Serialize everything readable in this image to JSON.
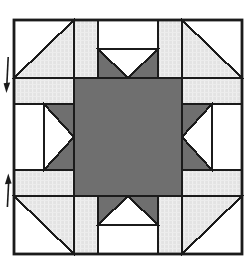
{
  "diagram": {
    "canvas": {
      "width": 248,
      "height": 280
    },
    "colors": {
      "background": "#ffffff",
      "outline": "#1b1b1b",
      "patch_white": "#ffffff",
      "patch_light": "#e3e3e3",
      "patch_light_texture": "#efefef",
      "patch_dark": "#6f6f6f",
      "arrow": "#1b1b1b"
    },
    "stroke": {
      "border_width": 2.8,
      "seam_width": 2.1,
      "arrow_shaft_width": 1.6
    },
    "block": {
      "x": 14,
      "y": 20,
      "width": 228,
      "height": 234
    },
    "pieces": [
      {
        "name": "center-square",
        "shape": "rect",
        "fill": "dark",
        "x": 74,
        "y": 78,
        "w": 108,
        "h": 118
      },
      {
        "name": "spacer-top-left",
        "shape": "rect",
        "fill": "light",
        "x": 74,
        "y": 20,
        "w": 24,
        "h": 58
      },
      {
        "name": "spacer-top-right",
        "shape": "rect",
        "fill": "light",
        "x": 158,
        "y": 20,
        "w": 24,
        "h": 58
      },
      {
        "name": "spacer-bottom-left",
        "shape": "rect",
        "fill": "light",
        "x": 74,
        "y": 196,
        "w": 24,
        "h": 58
      },
      {
        "name": "spacer-bottom-right",
        "shape": "rect",
        "fill": "light",
        "x": 158,
        "y": 196,
        "w": 24,
        "h": 58
      },
      {
        "name": "spacer-left-top",
        "shape": "rect",
        "fill": "light",
        "x": 14,
        "y": 78,
        "w": 60,
        "h": 26
      },
      {
        "name": "spacer-left-bottom",
        "shape": "rect",
        "fill": "light",
        "x": 14,
        "y": 170,
        "w": 60,
        "h": 26
      },
      {
        "name": "spacer-right-top",
        "shape": "rect",
        "fill": "light",
        "x": 182,
        "y": 78,
        "w": 60,
        "h": 26
      },
      {
        "name": "spacer-right-bottom",
        "shape": "rect",
        "fill": "light",
        "x": 182,
        "y": 170,
        "w": 60,
        "h": 26
      },
      {
        "name": "top-edge-rect",
        "shape": "rect",
        "fill": "white",
        "x": 98,
        "y": 20,
        "w": 60,
        "h": 29
      },
      {
        "name": "top-geese-ground",
        "shape": "rect",
        "fill": "dark",
        "x": 98,
        "y": 49,
        "w": 60,
        "h": 29
      },
      {
        "name": "top-geese-point",
        "shape": "polygon",
        "fill": "white",
        "points": [
          [
            98,
            49
          ],
          [
            158,
            49
          ],
          [
            128,
            78
          ]
        ]
      },
      {
        "name": "bottom-edge-rect",
        "shape": "rect",
        "fill": "white",
        "x": 98,
        "y": 225,
        "w": 60,
        "h": 29
      },
      {
        "name": "bottom-geese-ground",
        "shape": "rect",
        "fill": "dark",
        "x": 98,
        "y": 196,
        "w": 60,
        "h": 29
      },
      {
        "name": "bottom-geese-point",
        "shape": "polygon",
        "fill": "white",
        "points": [
          [
            98,
            225
          ],
          [
            158,
            225
          ],
          [
            128,
            196
          ]
        ]
      },
      {
        "name": "left-edge-rect",
        "shape": "rect",
        "fill": "white",
        "x": 14,
        "y": 104,
        "w": 30,
        "h": 66
      },
      {
        "name": "left-geese-ground",
        "shape": "rect",
        "fill": "dark",
        "x": 44,
        "y": 104,
        "w": 30,
        "h": 66
      },
      {
        "name": "left-geese-point",
        "shape": "polygon",
        "fill": "white",
        "points": [
          [
            44,
            104
          ],
          [
            44,
            170
          ],
          [
            74,
            137
          ]
        ]
      },
      {
        "name": "right-edge-rect",
        "shape": "rect",
        "fill": "white",
        "x": 212,
        "y": 104,
        "w": 30,
        "h": 66
      },
      {
        "name": "right-geese-ground",
        "shape": "rect",
        "fill": "dark",
        "x": 182,
        "y": 104,
        "w": 30,
        "h": 66
      },
      {
        "name": "right-geese-point",
        "shape": "polygon",
        "fill": "white",
        "points": [
          [
            212,
            104
          ],
          [
            212,
            170
          ],
          [
            182,
            137
          ]
        ]
      },
      {
        "name": "corner-tl-white",
        "shape": "polygon",
        "fill": "white",
        "points": [
          [
            14,
            20
          ],
          [
            74,
            20
          ],
          [
            14,
            78
          ]
        ]
      },
      {
        "name": "corner-tl-light",
        "shape": "polygon",
        "fill": "light",
        "points": [
          [
            74,
            20
          ],
          [
            74,
            78
          ],
          [
            14,
            78
          ]
        ]
      },
      {
        "name": "corner-tr-white",
        "shape": "polygon",
        "fill": "white",
        "points": [
          [
            182,
            20
          ],
          [
            242,
            20
          ],
          [
            242,
            78
          ]
        ]
      },
      {
        "name": "corner-tr-light",
        "shape": "polygon",
        "fill": "light",
        "points": [
          [
            182,
            20
          ],
          [
            242,
            78
          ],
          [
            182,
            78
          ]
        ]
      },
      {
        "name": "corner-bl-light",
        "shape": "polygon",
        "fill": "light",
        "points": [
          [
            14,
            196
          ],
          [
            74,
            196
          ],
          [
            74,
            254
          ]
        ]
      },
      {
        "name": "corner-bl-white",
        "shape": "polygon",
        "fill": "white",
        "points": [
          [
            14,
            196
          ],
          [
            74,
            254
          ],
          [
            14,
            254
          ]
        ]
      },
      {
        "name": "corner-br-light",
        "shape": "polygon",
        "fill": "light",
        "points": [
          [
            182,
            196
          ],
          [
            242,
            196
          ],
          [
            182,
            254
          ]
        ]
      },
      {
        "name": "corner-br-white",
        "shape": "polygon",
        "fill": "white",
        "points": [
          [
            242,
            196
          ],
          [
            242,
            254
          ],
          [
            182,
            254
          ]
        ]
      }
    ],
    "arrows": [
      {
        "name": "direction-arrow-down",
        "direction": "down",
        "shaft": [
          [
            8.2,
            57
          ],
          [
            6.9,
            84
          ]
        ],
        "head": [
          [
            3.6,
            83.2
          ],
          [
            10.2,
            82.6
          ],
          [
            6.4,
            93
          ]
        ]
      },
      {
        "name": "direction-arrow-up",
        "direction": "up",
        "shaft": [
          [
            8.6,
            183
          ],
          [
            7.4,
            207
          ]
        ],
        "head": [
          [
            4.9,
            184.2
          ],
          [
            11.6,
            183.4
          ],
          [
            8.3,
            173.5
          ]
        ]
      }
    ]
  }
}
